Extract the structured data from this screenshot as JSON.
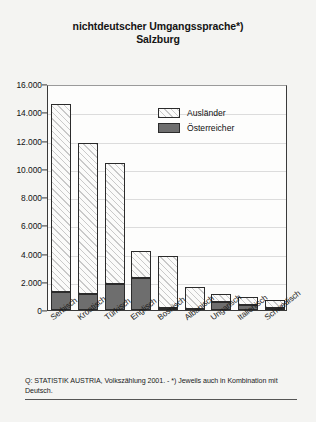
{
  "chart_data": {
    "type": "bar",
    "title": "nichtdeutscher Umgangssprache*)",
    "subtitle": "Salzburg",
    "xlabel": "",
    "ylabel": "",
    "ylim": [
      0,
      16000
    ],
    "grid": true,
    "stacked": true,
    "legend_position": "inside-top-right",
    "categories": [
      "Serbisch",
      "Kroatisch",
      "Türkisch",
      "Englisch",
      "Bosnisch",
      "Albanisch",
      "Ungarisch",
      "Italienisch",
      "Schwedisch"
    ],
    "ytick_labels": [
      "16.000",
      "14.000",
      "12.000",
      "10.000",
      "8.000",
      "6.000",
      "4.000",
      "2.000",
      "0"
    ],
    "ytick_values": [
      16000,
      14000,
      12000,
      10000,
      8000,
      6000,
      4000,
      2000,
      0
    ],
    "series": [
      {
        "name": "Österreicher",
        "color": "#6e6e6e",
        "pattern": "solid",
        "values": [
          1300,
          1150,
          1850,
          2300,
          150,
          80,
          600,
          350,
          150
        ]
      },
      {
        "name": "Ausländer",
        "color": "#fbfbfa",
        "pattern": "diagonal-hatch",
        "values": [
          13300,
          10650,
          8550,
          1900,
          3650,
          1570,
          550,
          600,
          550
        ]
      }
    ],
    "totals": [
      14600,
      11800,
      10400,
      4200,
      3800,
      1650,
      1150,
      950,
      700
    ],
    "footnote": "Q: STATISTIK AUSTRIA, Volkszählung 2001. - *) Jeweils auch in Kombination mit Deutsch."
  },
  "legend": {
    "items": [
      {
        "label": "Ausländer",
        "swatch": "hatched-swatch"
      },
      {
        "label": "Österreicher",
        "swatch": "solid-gray-swatch"
      }
    ]
  }
}
